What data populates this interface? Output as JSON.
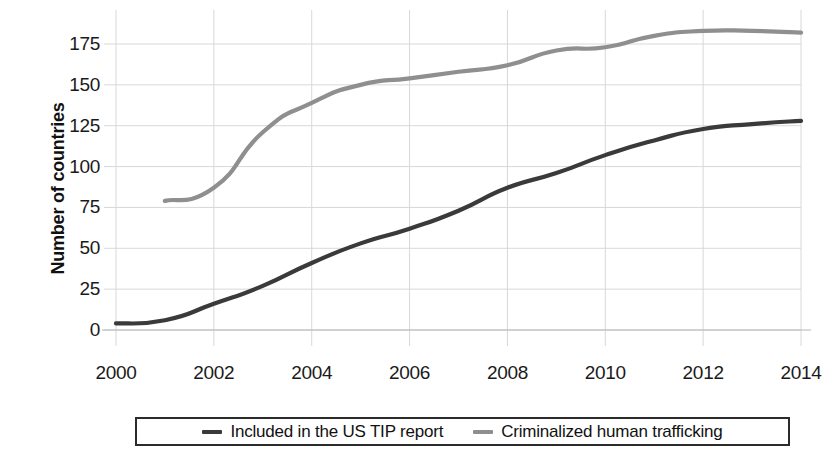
{
  "chart_data": {
    "type": "line",
    "title": "",
    "xlabel": "",
    "ylabel": "Number of countries",
    "xlim": [
      2000,
      2014
    ],
    "ylim": [
      0,
      185
    ],
    "yticks": [
      0,
      25,
      50,
      75,
      100,
      125,
      150,
      175
    ],
    "xticks": [
      2000,
      2002,
      2004,
      2006,
      2008,
      2010,
      2012,
      2014
    ],
    "grid": true,
    "legend_position": "bottom",
    "x": [
      2000,
      2001,
      2002,
      2003,
      2004,
      2005,
      2006,
      2007,
      2008,
      2009,
      2010,
      2011,
      2012,
      2013,
      2014
    ],
    "series": [
      {
        "name": "Included in the US TIP report",
        "color": "#3a3a3a",
        "x": [
          2000,
          2001,
          2002,
          2003,
          2004,
          2005,
          2006,
          2007,
          2008,
          2009,
          2010,
          2011,
          2012,
          2013,
          2014
        ],
        "values": [
          4,
          6,
          16,
          27,
          41,
          53,
          62,
          73,
          87,
          96,
          107,
          116,
          123,
          126,
          128
        ]
      },
      {
        "name": "Criminalized human trafficking",
        "color": "#8f8f8f",
        "x": [
          2001,
          2002,
          2003,
          2004,
          2005,
          2006,
          2007,
          2008,
          2009,
          2010,
          2011,
          2012,
          2013,
          2014
        ],
        "values": [
          79,
          87,
          121,
          139,
          150,
          154,
          158,
          162,
          171,
          173,
          180,
          183,
          183,
          182
        ]
      }
    ]
  },
  "axis": {
    "y_title": "Number of countries",
    "y_tick_labels": [
      "175",
      "150",
      "125",
      "100",
      "75",
      "50",
      "25",
      "0"
    ],
    "x_tick_labels": [
      "2000",
      "2002",
      "2004",
      "2006",
      "2008",
      "2010",
      "2012",
      "2014"
    ]
  },
  "legend": {
    "items": [
      {
        "label": "Included in the US TIP report",
        "color": "#3a3a3a"
      },
      {
        "label": "Criminalized human trafficking",
        "color": "#8f8f8f"
      }
    ]
  },
  "colors": {
    "series_dark": "#3a3a3a",
    "series_light": "#8f8f8f",
    "grid": "#d8d8d8",
    "axis": "#9a9a9a",
    "text": "#111111",
    "background": "#ffffff"
  }
}
